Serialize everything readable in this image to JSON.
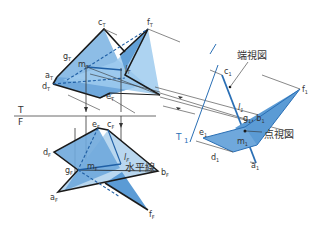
{
  "diagram": {
    "type": "descriptive-geometry",
    "views": {
      "top": {
        "labels": {
          "a": "a",
          "c": "c",
          "d": "d",
          "e": "e",
          "f": "f",
          "g": "g",
          "m": "m",
          "l": "l"
        },
        "suffix": "T"
      },
      "front": {
        "labels": {
          "a": "a",
          "b": "b",
          "c": "c",
          "d": "d",
          "e": "e",
          "f": "f",
          "g": "g",
          "m": "m",
          "l": "l"
        },
        "suffix": "F"
      },
      "auxiliary": {
        "labels": {
          "a": "a",
          "c": "c",
          "d": "d",
          "e": "e",
          "f": "f",
          "gb": "g",
          "b": "b",
          "m": "m",
          "l": "l"
        },
        "suffix": "1"
      }
    },
    "folding_lines": {
      "tf_top": "T",
      "tf_bottom": "F",
      "t1_t": "T",
      "t1_1": "1"
    },
    "annotations": {
      "edge_view": "端視図",
      "point_view": "点視図",
      "horizontal_line": "水平線"
    },
    "colors": {
      "fill_dark": "#6fa8dc",
      "fill_light": "#b9d7ef",
      "edge": "#1a1a1a",
      "line_blue": "#2a6fb5",
      "projection": "#555555"
    }
  }
}
